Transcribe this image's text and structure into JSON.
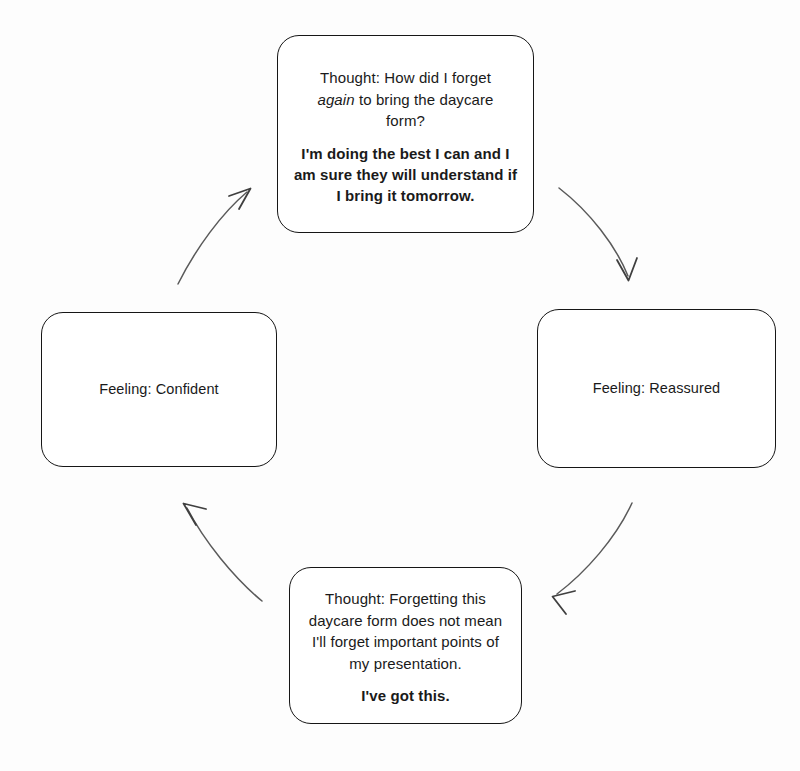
{
  "diagram": {
    "background_color": "#fdfdfd",
    "stroke_color": "#161616",
    "arrow_color": "#4a4a4a",
    "nodes": [
      {
        "id": "thought-top",
        "position": "top",
        "type": "thought",
        "line1": "Thought: How did I forget",
        "line2_pre": "",
        "line2_em": "again",
        "line2_post": " to bring the daycare",
        "line3": "form?",
        "affirmation": "I'm doing the best I can and I am sure they will understand if I bring it tomorrow."
      },
      {
        "id": "feeling-right",
        "position": "right",
        "type": "feeling",
        "label": "Feeling: Reassured"
      },
      {
        "id": "thought-bottom",
        "position": "bottom",
        "type": "thought",
        "body": "Thought: Forgetting this daycare form does not mean I'll forget important points of my presentation.",
        "affirmation": "I've got this."
      },
      {
        "id": "feeling-left",
        "position": "left",
        "type": "feeling",
        "label": "Feeling: Confident"
      }
    ],
    "arrows": [
      {
        "id": "arrow-top-to-right",
        "from": "thought-top",
        "to": "feeling-right",
        "direction": "down-right"
      },
      {
        "id": "arrow-right-to-bottom",
        "from": "feeling-right",
        "to": "thought-bottom",
        "direction": "down-left"
      },
      {
        "id": "arrow-bottom-to-left",
        "from": "thought-bottom",
        "to": "feeling-left",
        "direction": "up-left"
      },
      {
        "id": "arrow-left-to-top",
        "from": "feeling-left",
        "to": "thought-top",
        "direction": "up-right"
      }
    ]
  }
}
